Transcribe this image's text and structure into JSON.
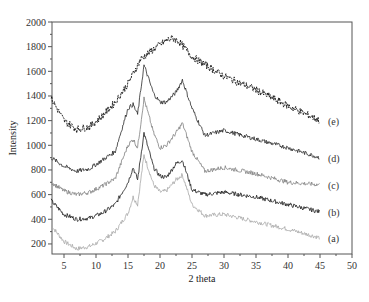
{
  "chart_data": {
    "type": "line",
    "title": "",
    "xlabel": "2 theta",
    "ylabel": "Intensity",
    "xlim": [
      3,
      50
    ],
    "ylim": [
      120,
      2000
    ],
    "xticks": [
      5,
      10,
      15,
      20,
      25,
      30,
      35,
      40,
      45,
      50
    ],
    "yticks": [
      200,
      400,
      600,
      800,
      1000,
      1200,
      1400,
      1600,
      1800,
      2000
    ],
    "grid": false,
    "legend_position": "inline labels at right end of each curve",
    "series": [
      {
        "name": "(a)",
        "color": "#a8a8a8",
        "x": [
          3,
          5,
          7,
          9,
          11,
          13,
          15,
          15.8,
          16.5,
          17.5,
          19,
          20,
          21,
          22.5,
          23.5,
          25,
          27,
          30,
          35,
          40,
          45
        ],
        "y": [
          350,
          220,
          160,
          180,
          230,
          300,
          450,
          580,
          520,
          920,
          680,
          620,
          630,
          720,
          760,
          520,
          430,
          440,
          380,
          320,
          250
        ]
      },
      {
        "name": "(b)",
        "color": "#1a1a1a",
        "x": [
          3,
          5,
          7,
          9,
          11,
          13,
          15,
          15.8,
          16.5,
          17.5,
          19,
          20,
          21,
          22.5,
          23.5,
          25,
          27,
          30,
          35,
          40,
          45
        ],
        "y": [
          550,
          440,
          400,
          410,
          450,
          520,
          700,
          820,
          720,
          1100,
          820,
          750,
          740,
          850,
          880,
          640,
          600,
          620,
          580,
          520,
          460
        ]
      },
      {
        "name": "(c)",
        "color": "#808080",
        "x": [
          3,
          5,
          7,
          9,
          11,
          13,
          15,
          15.8,
          16.5,
          17.5,
          19,
          20,
          21,
          22.5,
          23.5,
          25,
          27,
          30,
          35,
          40,
          45
        ],
        "y": [
          700,
          630,
          600,
          620,
          670,
          730,
          1000,
          1050,
          980,
          1380,
          1100,
          980,
          1000,
          1100,
          1180,
          950,
          790,
          820,
          770,
          700,
          680
        ]
      },
      {
        "name": "(d)",
        "color": "#2a2a2a",
        "x": [
          3,
          5,
          7,
          9,
          11,
          13,
          15,
          15.8,
          16.5,
          17.5,
          19,
          20,
          21,
          22.5,
          23.5,
          25,
          27,
          30,
          35,
          40,
          45
        ],
        "y": [
          900,
          830,
          790,
          810,
          880,
          950,
          1300,
          1330,
          1250,
          1650,
          1420,
          1350,
          1350,
          1430,
          1530,
          1300,
          1080,
          1120,
          1050,
          980,
          900
        ]
      },
      {
        "name": "(e)",
        "color": "#111111",
        "x": [
          3,
          5,
          7,
          9,
          11,
          13,
          15,
          17,
          19,
          21,
          22,
          23,
          25,
          30,
          35,
          40,
          45
        ],
        "y": [
          1380,
          1200,
          1130,
          1150,
          1240,
          1350,
          1500,
          1700,
          1780,
          1850,
          1870,
          1840,
          1720,
          1560,
          1450,
          1320,
          1200
        ]
      }
    ]
  }
}
